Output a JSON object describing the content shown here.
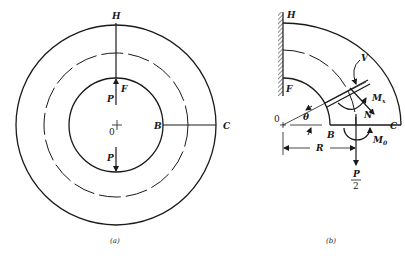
{
  "figure_a": {
    "caption": "(a)",
    "labels": {
      "H": "H",
      "F": "F",
      "P_top": "P",
      "P_bottom": "P",
      "O": "0",
      "B": "B",
      "C": "C"
    }
  },
  "figure_b": {
    "caption": "(b)",
    "labels": {
      "H": "H",
      "F": "F",
      "O": "0",
      "theta": "θ",
      "B": "B",
      "C": "C",
      "V": "V",
      "N": "N",
      "Mx": "M",
      "Mx_sub": "x",
      "M0": "M",
      "M0_sub": "0",
      "R": "R",
      "P_num": "P",
      "P_den": "2"
    }
  },
  "colors": {
    "ink": "#1a1a1a",
    "background": "#ffffff"
  }
}
